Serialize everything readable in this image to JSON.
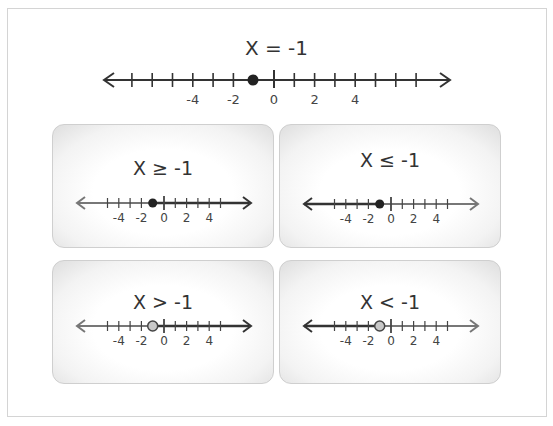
{
  "main": {
    "title": "X = -1",
    "number_line": {
      "range": [
        -7,
        7
      ],
      "labels": [
        "-4",
        "-2",
        "0",
        "2",
        "4"
      ],
      "point": -1,
      "point_style": "closed"
    }
  },
  "panels": [
    {
      "title": "X ≥ -1",
      "point": -1,
      "point_style": "closed",
      "shade": "right",
      "labels": [
        "-4",
        "-2",
        "0",
        "2",
        "4"
      ]
    },
    {
      "title": "X ≤ -1",
      "point": -1,
      "point_style": "closed",
      "shade": "left",
      "labels": [
        "-4",
        "-2",
        "0",
        "2",
        "4"
      ]
    },
    {
      "title": "X > -1",
      "point": -1,
      "point_style": "open",
      "shade": "right",
      "labels": [
        "-4",
        "-2",
        "0",
        "2",
        "4"
      ]
    },
    {
      "title": "X < -1",
      "point": -1,
      "point_style": "open",
      "shade": "left",
      "labels": [
        "-4",
        "-2",
        "0",
        "2",
        "4"
      ]
    }
  ],
  "colors": {
    "line_dark": "#333333",
    "line_light": "#777777",
    "open_fill": "#c8c8c8",
    "panel_border": "#cfcfcf"
  }
}
